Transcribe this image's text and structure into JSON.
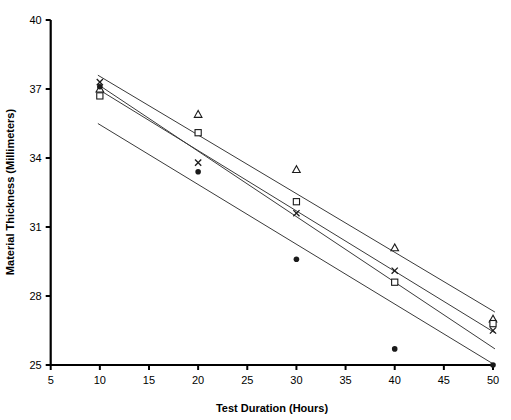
{
  "chart_data": {
    "type": "scatter",
    "title": "",
    "xlabel": "Test Duration (Hours)",
    "ylabel": "Material Thickness (Millimeters)",
    "xlim": [
      5,
      50
    ],
    "ylim": [
      25,
      40
    ],
    "xticks": [
      5,
      10,
      15,
      20,
      25,
      30,
      35,
      40,
      45,
      50
    ],
    "yticks": [
      25,
      28,
      31,
      34,
      37,
      40
    ],
    "grid": false,
    "legend": "none",
    "x": [
      10,
      20,
      30,
      40,
      50
    ],
    "series": [
      {
        "name": "triangle",
        "marker": "open-triangle",
        "values": [
          37.0,
          35.9,
          33.5,
          30.1,
          27.0
        ]
      },
      {
        "name": "square",
        "marker": "open-square",
        "values": [
          36.7,
          35.1,
          32.1,
          28.6,
          26.8
        ]
      },
      {
        "name": "cross",
        "marker": "x-cross",
        "values": [
          37.3,
          33.8,
          31.6,
          29.1,
          26.5
        ]
      },
      {
        "name": "circle",
        "marker": "filled-circle",
        "values": [
          37.1,
          33.4,
          29.6,
          25.7,
          25.0
        ]
      }
    ],
    "fit_lines": [
      {
        "name": "fit-line-triangle",
        "x0": 9.8,
        "y0": 37.6,
        "x1": 50.2,
        "y1": 27.3
      },
      {
        "name": "fit-line-square",
        "x0": 9.8,
        "y0": 37.0,
        "x1": 50.2,
        "y1": 26.4
      },
      {
        "name": "fit-line-cross",
        "x0": 9.8,
        "y0": 37.2,
        "x1": 50.2,
        "y1": 25.7
      },
      {
        "name": "fit-line-circle",
        "x0": 9.8,
        "y0": 35.5,
        "x1": 50.2,
        "y1": 25.0
      }
    ]
  },
  "colors": {
    "axis": "#000000",
    "marker": "#1a1a1a",
    "line": "#3a3a3a",
    "background": "#ffffff"
  },
  "axes": {
    "x_title": "Test Duration (Hours)",
    "y_title": "Material Thickness (Millimeters)",
    "x_tick_labels": [
      "5",
      "10",
      "15",
      "20",
      "25",
      "30",
      "35",
      "40",
      "45",
      "50"
    ],
    "y_tick_labels": [
      "25",
      "28",
      "31",
      "34",
      "37",
      "40"
    ]
  }
}
